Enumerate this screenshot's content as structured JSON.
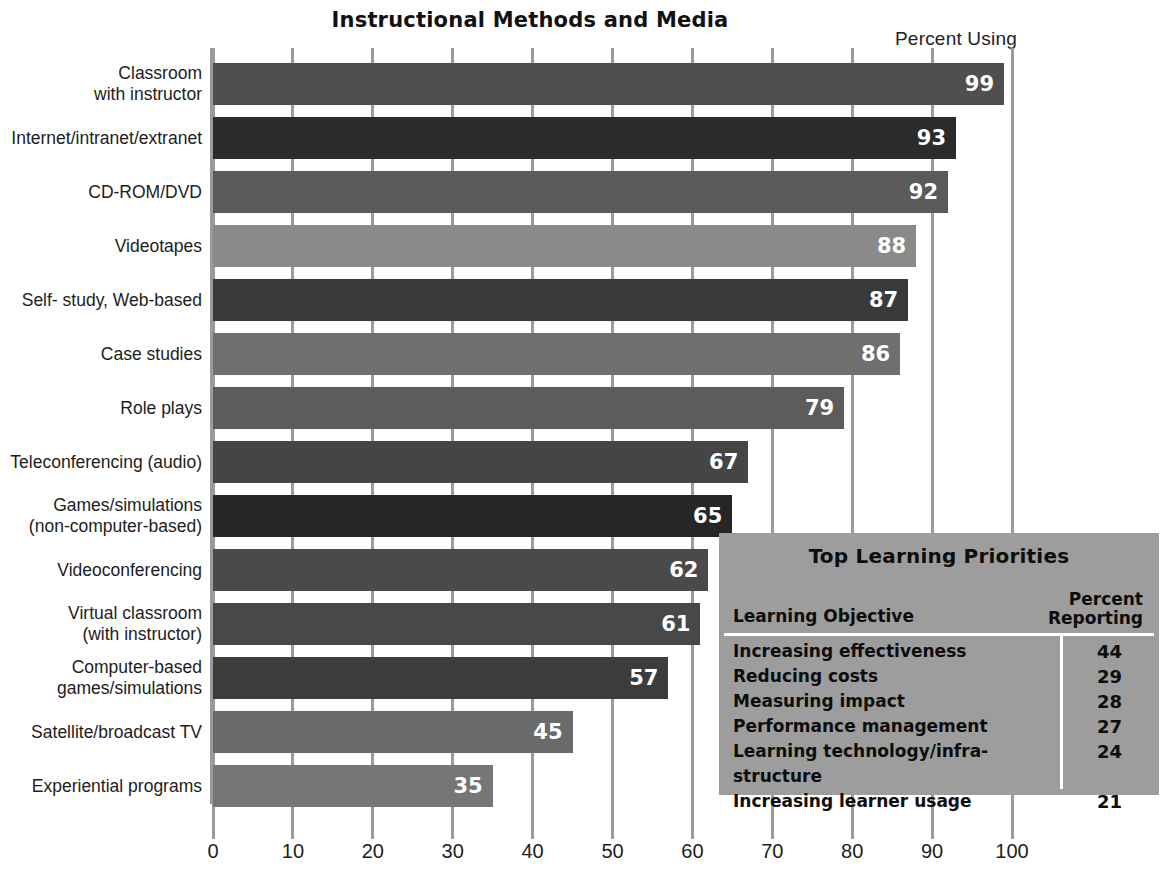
{
  "chart_data": {
    "type": "bar",
    "orientation": "horizontal",
    "title": "Instructional Methods and Media",
    "value_axis_caption": "Percent Using",
    "xlabel": "",
    "ylabel": "",
    "xlim": [
      0,
      100
    ],
    "grid": true,
    "legend": "none",
    "tick_labels": [
      "0",
      "10",
      "20",
      "30",
      "40",
      "50",
      "60",
      "70",
      "80",
      "90",
      "100"
    ],
    "ticks": [
      0,
      10,
      20,
      30,
      40,
      50,
      60,
      70,
      80,
      90,
      100
    ],
    "categories": [
      "Classroom\nwith instructor",
      "Internet/intranet/extranet",
      "CD-ROM/DVD",
      "Videotapes",
      "Self- study, Web-based",
      "Case studies",
      "Role plays",
      "Teleconferencing (audio)",
      "Games/simulations\n(non-computer-based)",
      "Videoconferencing",
      "Virtual classroom\n(with instructor)",
      "Computer-based\ngames/simulations",
      "Satellite/broadcast TV",
      "Experiential programs"
    ],
    "values": [
      99,
      93,
      92,
      88,
      87,
      86,
      79,
      67,
      65,
      62,
      61,
      57,
      45,
      35
    ],
    "bar_colors": [
      "#4f4f4f",
      "#2b2b2b",
      "#5a5a5a",
      "#8a8a8a",
      "#3a3a3a",
      "#6f6f6f",
      "#5c5c5c",
      "#454545",
      "#262626",
      "#4a4a4a",
      "#484848",
      "#3c3c3c",
      "#6a6a6a",
      "#767676"
    ],
    "value_label_color": "#ffffff"
  },
  "inset_table": {
    "title": "Top Learning Priorities",
    "columns": [
      "Learning Objective",
      "Percent\nReporting"
    ],
    "column_header_objective": "Learning Objective",
    "column_header_percent": "Percent\nReporting",
    "rows": [
      {
        "objective": "Increasing effectiveness",
        "percent": "44"
      },
      {
        "objective": "Reducing costs",
        "percent": "29"
      },
      {
        "objective": "Measuring impact",
        "percent": "28"
      },
      {
        "objective": "Performance management",
        "percent": "27"
      },
      {
        "objective": "Learning technology/infra-\n   structure",
        "percent": "24"
      },
      {
        "objective": "Increasing learner usage",
        "percent": "21"
      }
    ],
    "background_color": "#9d9d9d",
    "rule_color": "#ffffff"
  },
  "axis": {
    "line_color": "#9a9a9a"
  }
}
